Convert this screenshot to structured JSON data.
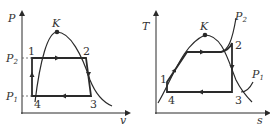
{
  "pv_diagram": {
    "y_axis": "P",
    "x_axis": "v",
    "critical_point": "K",
    "pressure_high": {
      "main": "P",
      "sub": "2"
    },
    "pressure_low": {
      "main": "P",
      "sub": "1"
    },
    "points": [
      "1",
      "2",
      "3",
      "4"
    ]
  },
  "ts_diagram": {
    "y_axis": "T",
    "x_axis": "s",
    "critical_point": "K",
    "isobar_high": {
      "main": "P",
      "sub": "2"
    },
    "isobar_low": {
      "main": "P",
      "sub": "1"
    },
    "points": [
      "1",
      "2",
      "3",
      "4"
    ]
  },
  "colors": {
    "line": "#2a2a2a",
    "text": "#333333",
    "dash": "#555555"
  }
}
